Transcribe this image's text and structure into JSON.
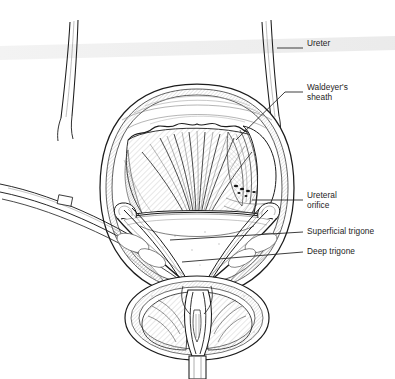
{
  "figure": {
    "type": "medical-line-illustration",
    "view": "anterior coronal cut-away of bladder and prostate",
    "background_color": "#ffffff",
    "ink_color": "#1c1c1c",
    "scan_band": {
      "present": true,
      "color": "#ececec",
      "description": "faint horizontal photocopy band across upper third"
    }
  },
  "running_head": {
    "left": "",
    "separator": "/",
    "right": ""
  },
  "labels": [
    {
      "id": "ureter",
      "text": "Ureter",
      "lines": [
        "Ureter"
      ],
      "x": 307,
      "y": 44,
      "leader": {
        "from": [
          303,
          48
        ],
        "to": [
          277,
          48
        ],
        "style": "straight"
      }
    },
    {
      "id": "waldeyers-sheath",
      "text": "Waldeyer's sheath",
      "lines": [
        "Waldeyer's",
        "sheath"
      ],
      "x": 307,
      "y": 88,
      "leader": {
        "from": [
          303,
          92
        ],
        "to": [
          236,
          140
        ],
        "style": "straight-diagonal"
      }
    },
    {
      "id": "ureteral-orifice",
      "text": "Ureteral orifice",
      "lines": [
        "Ureteral",
        "orifice"
      ],
      "x": 307,
      "y": 196,
      "leader": {
        "from": [
          303,
          200
        ],
        "to": [
          252,
          200
        ],
        "style": "straight"
      }
    },
    {
      "id": "superficial-trigone",
      "text": "Superficial trigone",
      "lines": [
        "Superficial trigone"
      ],
      "x": 307,
      "y": 229,
      "leader": {
        "from": [
          303,
          232
        ],
        "to": [
          170,
          240
        ],
        "style": "straight"
      }
    },
    {
      "id": "deep-trigone",
      "text": "Deep trigone",
      "lines": [
        "Deep trigone"
      ],
      "x": 307,
      "y": 249,
      "leader": {
        "from": [
          303,
          252
        ],
        "to": [
          182,
          262
        ],
        "style": "straight"
      }
    }
  ],
  "structures": [
    {
      "id": "left-ureter",
      "name": "Left ureter (descending)"
    },
    {
      "id": "right-ureter",
      "name": "Right ureter (descending)"
    },
    {
      "id": "bladder-dome",
      "name": "Bladder dome / detrusor outer wall"
    },
    {
      "id": "rugae",
      "name": "Mucosal rugae of bladder interior"
    },
    {
      "id": "trigone",
      "name": "Trigone (triangular smooth mucosa)"
    },
    {
      "id": "orifice-left",
      "name": "Left ureteral orifice"
    },
    {
      "id": "orifice-right",
      "name": "Right ureteral orifice (cut-away tunnel)"
    },
    {
      "id": "bladder-neck",
      "name": "Bladder neck / internal urethral meatus"
    },
    {
      "id": "prostate",
      "name": "Prostate gland (coronal section)"
    },
    {
      "id": "urethral-crest",
      "name": "Urethral crest / verumontanum"
    },
    {
      "id": "urethra",
      "name": "Prostatic urethra"
    },
    {
      "id": "vas-deferens",
      "name": "Vas deferens / vessels crossing left wall"
    }
  ]
}
